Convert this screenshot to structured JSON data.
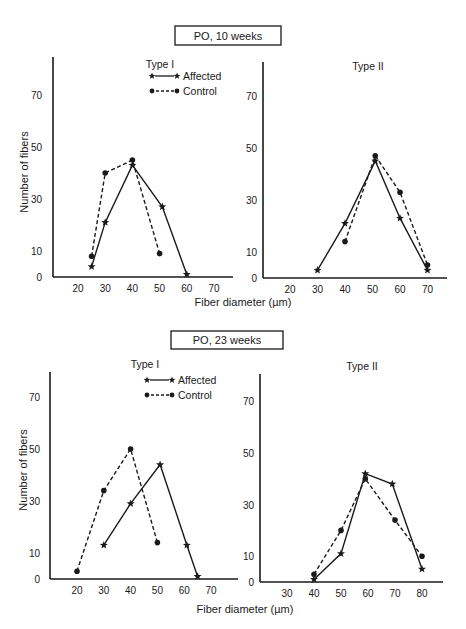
{
  "figure": {
    "ylabel": "Number of fibers",
    "xlabel": "Fiber diameter (µm)",
    "legend": {
      "affected": "Affected",
      "control": "Control"
    },
    "colors": {
      "ink": "#1a1a1a",
      "background": "#ffffff"
    }
  },
  "sections": [
    {
      "title": "PO, 10 weeks"
    },
    {
      "title": "PO, 23 weeks"
    }
  ],
  "chart_data": [
    {
      "type": "line",
      "section": "PO, 10 weeks",
      "title": "Type I",
      "xlabel": "Fiber diameter (µm)",
      "ylabel": "Number of fibers",
      "xticks": [
        20,
        30,
        40,
        50,
        60,
        70
      ],
      "yticks": [
        0,
        10,
        30,
        50,
        70
      ],
      "xlim": [
        15,
        75
      ],
      "ylim": [
        0,
        80
      ],
      "grid": false,
      "legend_position": "top-right",
      "series": [
        {
          "name": "Affected",
          "style": "solid",
          "marker": "star",
          "x": [
            25,
            30,
            40,
            51,
            60
          ],
          "y": [
            4,
            21,
            43,
            27,
            1
          ]
        },
        {
          "name": "Control",
          "style": "dashed",
          "marker": "circle",
          "x": [
            25,
            30,
            40,
            50
          ],
          "y": [
            8,
            40,
            45,
            9
          ]
        }
      ]
    },
    {
      "type": "line",
      "section": "PO, 10 weeks",
      "title": "Type II",
      "xlabel": "Fiber diameter (µm)",
      "ylabel": "Number of fibers",
      "xticks": [
        20,
        30,
        40,
        50,
        60,
        70
      ],
      "yticks": [
        0,
        10,
        30,
        50,
        70
      ],
      "xlim": [
        15,
        75
      ],
      "ylim": [
        0,
        80
      ],
      "grid": false,
      "series": [
        {
          "name": "Affected",
          "style": "solid",
          "marker": "star",
          "x": [
            30,
            40,
            51,
            60,
            70
          ],
          "y": [
            3,
            21,
            45,
            23,
            3
          ]
        },
        {
          "name": "Control",
          "style": "dashed",
          "marker": "circle",
          "x": [
            40,
            51,
            60,
            70
          ],
          "y": [
            14,
            47,
            33,
            5
          ]
        }
      ]
    },
    {
      "type": "line",
      "section": "PO, 23 weeks",
      "title": "Type I",
      "xlabel": "Fiber diameter (µm)",
      "ylabel": "Number of fibers",
      "xticks": [
        20,
        30,
        40,
        50,
        60,
        70
      ],
      "yticks": [
        0,
        10,
        30,
        50,
        70
      ],
      "xlim": [
        15,
        75
      ],
      "ylim": [
        0,
        80
      ],
      "grid": false,
      "legend_position": "top-right",
      "series": [
        {
          "name": "Affected",
          "style": "solid",
          "marker": "star",
          "x": [
            30,
            40,
            51,
            61,
            65
          ],
          "y": [
            13,
            29,
            44,
            13,
            1
          ]
        },
        {
          "name": "Control",
          "style": "dashed",
          "marker": "circle",
          "x": [
            20,
            30,
            40,
            50
          ],
          "y": [
            3,
            34,
            50,
            14
          ]
        }
      ]
    },
    {
      "type": "line",
      "section": "PO, 23 weeks",
      "title": "Type II",
      "xlabel": "Fiber diameter (µm)",
      "ylabel": "Number of fibers",
      "xticks": [
        30,
        40,
        50,
        60,
        70,
        80
      ],
      "yticks": [
        0,
        10,
        30,
        50,
        70
      ],
      "xlim": [
        20,
        85
      ],
      "ylim": [
        0,
        80
      ],
      "grid": false,
      "series": [
        {
          "name": "Affected",
          "style": "solid",
          "marker": "star",
          "x": [
            40,
            50,
            59,
            69,
            80
          ],
          "y": [
            1,
            11,
            42,
            38,
            5
          ]
        },
        {
          "name": "Control",
          "style": "dashed",
          "marker": "circle",
          "x": [
            40,
            50,
            59,
            70,
            80
          ],
          "y": [
            3,
            20,
            40,
            24,
            10
          ]
        }
      ]
    }
  ]
}
